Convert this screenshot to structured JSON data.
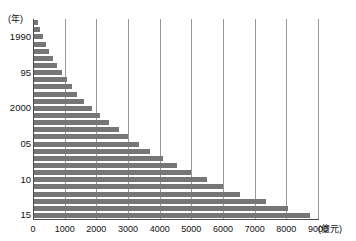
{
  "title_fragment": "",
  "axis": {
    "y_unit_label": "(年)",
    "x_unit_label": "(億元)"
  },
  "chart_data": {
    "type": "bar",
    "orientation": "horizontal",
    "title": "",
    "xlabel": "(億元)",
    "ylabel": "(年)",
    "xlim": [
      0,
      9000
    ],
    "xticks": [
      0,
      1000,
      2000,
      3000,
      4000,
      5000,
      6000,
      7000,
      8000,
      9000
    ],
    "xtick_labels": [
      "0",
      "1000",
      "2000",
      "3000",
      "4000",
      "5000",
      "6000",
      "7000",
      "8000",
      "9000"
    ],
    "ytick_labels": [
      "1990",
      "95",
      "2000",
      "05",
      "10",
      "15"
    ],
    "ytick_years": [
      1990,
      1995,
      2000,
      2005,
      2010,
      2015
    ],
    "grid": "vertical",
    "legend": "none",
    "bar_color": "#767676",
    "categories": [
      1988,
      1989,
      1990,
      1991,
      1992,
      1993,
      1994,
      1995,
      1996,
      1997,
      1998,
      1999,
      2000,
      2001,
      2002,
      2003,
      2004,
      2005,
      2006,
      2007,
      2008,
      2009,
      2010,
      2011,
      2012,
      2013,
      2014,
      2015
    ],
    "values": [
      150,
      230,
      310,
      400,
      500,
      620,
      760,
      900,
      1060,
      1230,
      1400,
      1600,
      1850,
      2100,
      2400,
      2700,
      3000,
      3350,
      3700,
      4100,
      4550,
      5000,
      5500,
      6000,
      6550,
      7350,
      8050,
      8750
    ]
  }
}
